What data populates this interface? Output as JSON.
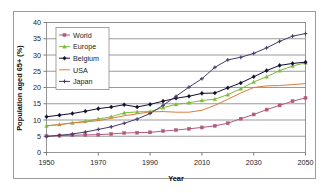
{
  "chart_data": {
    "type": "line",
    "title": "",
    "xlabel": "Year",
    "ylabel": "Population aged 65+ (%)",
    "xlim": [
      1950,
      2050
    ],
    "ylim": [
      0,
      40
    ],
    "xticks": [
      1950,
      1970,
      1990,
      2010,
      2030,
      2050
    ],
    "yticks": [
      0,
      5,
      10,
      15,
      20,
      25,
      30,
      35,
      40
    ],
    "grid": "horizontal",
    "legend_position": "upper-left-inside",
    "x": [
      1950,
      1955,
      1960,
      1965,
      1970,
      1975,
      1980,
      1985,
      1990,
      1995,
      2000,
      2005,
      2010,
      2015,
      2020,
      2025,
      2030,
      2035,
      2040,
      2045,
      2050
    ],
    "series": [
      {
        "name": "World",
        "color": "#b3587e",
        "marker": "square",
        "values": [
          5.1,
          5.2,
          5.3,
          5.4,
          5.5,
          5.7,
          6.0,
          6.1,
          6.2,
          6.6,
          6.9,
          7.3,
          7.7,
          8.2,
          9.0,
          10.4,
          11.7,
          13.2,
          14.5,
          15.8,
          16.8
        ]
      },
      {
        "name": "Europe",
        "color": "#7fba3c",
        "marker": "triangle",
        "values": [
          8.2,
          8.6,
          9.1,
          9.6,
          10.3,
          11.0,
          12.2,
          12.5,
          12.6,
          13.8,
          14.8,
          15.3,
          16.0,
          16.4,
          17.8,
          19.6,
          21.7,
          23.3,
          25.2,
          26.6,
          27.6
        ]
      },
      {
        "name": "Belgium",
        "color": "#10102e",
        "marker": "diamond",
        "values": [
          11.0,
          11.5,
          12.0,
          12.7,
          13.5,
          14.0,
          14.7,
          14.0,
          14.8,
          15.8,
          16.7,
          17.3,
          18.2,
          18.3,
          19.9,
          21.4,
          23.3,
          25.2,
          26.8,
          27.4,
          27.8
        ]
      },
      {
        "name": "USA",
        "color": "#dd7b3b",
        "marker": "none",
        "values": [
          8.2,
          8.6,
          9.1,
          9.4,
          9.8,
          10.5,
          11.3,
          11.9,
          12.5,
          12.6,
          12.4,
          12.4,
          13.0,
          14.5,
          16.4,
          18.3,
          20.0,
          20.5,
          20.6,
          20.9,
          21.2
        ]
      },
      {
        "name": "Japan",
        "color": "#4a3a6a",
        "marker": "cross",
        "values": [
          4.9,
          5.3,
          5.7,
          6.3,
          7.1,
          7.9,
          9.0,
          10.3,
          12.0,
          14.5,
          17.3,
          20.1,
          22.7,
          26.2,
          28.5,
          29.3,
          30.5,
          32.2,
          34.2,
          35.8,
          36.6
        ]
      }
    ]
  },
  "legend": {
    "entries": [
      "World",
      "Europe",
      "Belgium",
      "USA",
      "Japan"
    ]
  },
  "axes": {
    "x_title": "Year",
    "y_title": "Population aged 65+ (%)",
    "x_tick_labels": [
      "1950",
      "1970",
      "1990",
      "2010",
      "2030",
      "2050"
    ],
    "y_tick_labels": [
      "0",
      "5",
      "10",
      "15",
      "20",
      "25",
      "30",
      "35",
      "40"
    ]
  }
}
